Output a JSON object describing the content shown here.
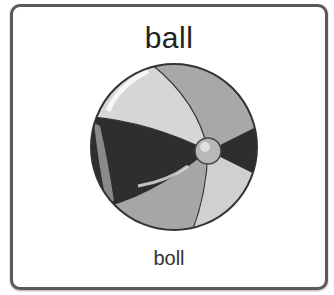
{
  "card": {
    "word": "ball",
    "phonetic": "boll",
    "image_icon": "beach-ball-icon"
  },
  "colors": {
    "border": "#5a5a5a",
    "panel_light": "#d9d9d9",
    "panel_mid": "#a9a9a9",
    "panel_dark": "#2e2e2e"
  }
}
